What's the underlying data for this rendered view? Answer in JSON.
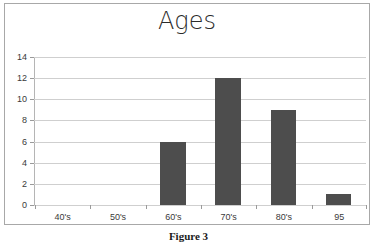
{
  "figure": {
    "caption": "Figure 3"
  },
  "chart_data": {
    "type": "bar",
    "title": "Ages",
    "xlabel": "",
    "ylabel": "",
    "categories": [
      "40's",
      "50's",
      "60's",
      "70's",
      "80's",
      "95"
    ],
    "values": [
      0,
      0,
      6,
      12,
      9,
      1
    ],
    "ylim": [
      0,
      14
    ],
    "ytick_labels": [
      "14",
      "12",
      "10",
      "8",
      "6",
      "4",
      "2",
      "0"
    ],
    "ytick_values": [
      14,
      12,
      10,
      8,
      6,
      4,
      2,
      0
    ],
    "grid": true,
    "legend": false,
    "legend_position": "none",
    "colors": {
      "bar": "#4d4d4d",
      "gridline": "#cfcfcf",
      "axis": "#9a9a9a",
      "border": "#a8a8a8",
      "title_text": "#2b2b2b",
      "tick_text": "#3a3a3a",
      "background": "#ffffff"
    }
  }
}
